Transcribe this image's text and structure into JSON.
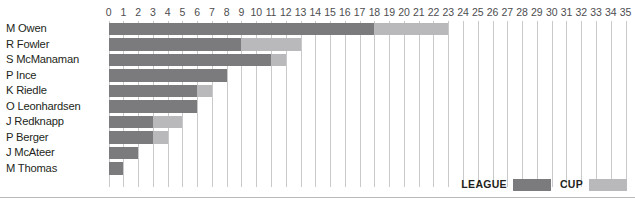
{
  "chart_data": {
    "type": "bar",
    "orientation": "horizontal",
    "stacked": true,
    "title": "",
    "subtitle": "",
    "xlabel": "",
    "ylabel": "",
    "xlim": [
      0,
      35
    ],
    "xticks": [
      0,
      1,
      2,
      3,
      4,
      5,
      6,
      7,
      8,
      9,
      10,
      11,
      12,
      13,
      14,
      15,
      16,
      17,
      18,
      19,
      20,
      21,
      22,
      23,
      24,
      25,
      26,
      27,
      28,
      29,
      30,
      31,
      32,
      33,
      34,
      35
    ],
    "xtick_labels": [
      "0",
      "1",
      "2",
      "3",
      "4",
      "5",
      "6",
      "7",
      "8",
      "9",
      "10",
      "11",
      "12",
      "13",
      "14",
      "15",
      "16",
      "17",
      "18",
      "19",
      "20",
      "21",
      "22",
      "23",
      "24",
      "25",
      "26",
      "27",
      "28",
      "29",
      "30",
      "31",
      "32",
      "33",
      "34",
      "35"
    ],
    "grid": true,
    "grid_axis": "x",
    "legend_position": "bottom-right",
    "categories": [
      "M Owen",
      "R Fowler",
      "S McManaman",
      "P Ince",
      "K Riedle",
      "O Leonhardsen",
      "J Redknapp",
      "P Berger",
      "J McAteer",
      "M Thomas"
    ],
    "series": [
      {
        "name": "LEAGUE",
        "color": "#7b7b7d",
        "values": [
          18,
          9,
          11,
          8,
          6,
          6,
          3,
          3,
          2,
          1
        ]
      },
      {
        "name": "CUP",
        "color": "#b9b9bb",
        "values": [
          5,
          4,
          1,
          0,
          1,
          0,
          2,
          1,
          0,
          0
        ]
      }
    ],
    "totals": [
      23,
      13,
      12,
      8,
      7,
      6,
      5,
      4,
      2,
      1
    ]
  },
  "legend": {
    "entries": [
      {
        "label": "LEAGUE",
        "color": "#7b7b7d"
      },
      {
        "label": "CUP",
        "color": "#b9b9bb"
      }
    ]
  },
  "colors": {
    "league": "#7b7b7d",
    "cup": "#b9b9bb",
    "gridline": "#c9c9cb",
    "axis_text": "#4d4d4f",
    "label_text": "#231f20",
    "background": "#ffffff"
  }
}
